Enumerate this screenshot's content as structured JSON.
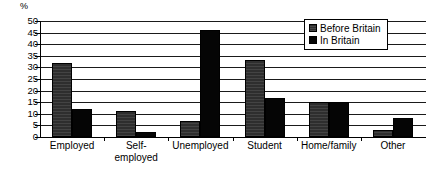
{
  "chart_data": {
    "type": "bar",
    "title": "",
    "subtitle": "",
    "xlabel": "",
    "ylabel": "%",
    "ylim": [
      0,
      50
    ],
    "ytick_step": 5,
    "yticks": [
      "50",
      "45",
      "40",
      "35",
      "30",
      "25",
      "20",
      "15",
      "10",
      "5",
      "0"
    ],
    "grid": true,
    "grid_axis": "y",
    "legend_position": "top-right",
    "categories": [
      "Employed",
      "Self-employed",
      "Unemployed",
      "Student",
      "Home/family",
      "Other"
    ],
    "category_label_lines": [
      [
        "Employed"
      ],
      [
        "Self-",
        "employed"
      ],
      [
        "Unemployed"
      ],
      [
        "Student"
      ],
      [
        "Home/family"
      ],
      [
        "Other"
      ]
    ],
    "series": [
      {
        "name": "Before Britain",
        "color": "#2e2e2e",
        "values": [
          32,
          11,
          7,
          33,
          15,
          3
        ]
      },
      {
        "name": "In Britain",
        "color": "#050505",
        "values": [
          12,
          2,
          46,
          17,
          15,
          8
        ]
      }
    ]
  },
  "legend": {
    "items": [
      {
        "label": "Before Britain",
        "swatch_class": "sw-before"
      },
      {
        "label": "In Britain",
        "swatch_class": "sw-in"
      }
    ]
  }
}
